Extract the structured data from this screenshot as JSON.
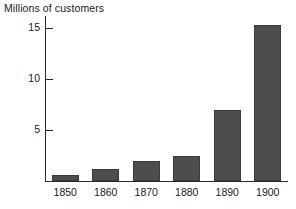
{
  "chart_data": {
    "type": "bar",
    "title": "",
    "ylabel": "Millions of customers",
    "xlabel": "",
    "categories": [
      "1850",
      "1860",
      "1870",
      "1880",
      "1890",
      "1900"
    ],
    "values": [
      0.6,
      1.2,
      2.0,
      2.5,
      7.0,
      15.3
    ],
    "ylim": [
      0,
      16.5
    ],
    "yticks": [
      5,
      10,
      15
    ],
    "ytick_labels": [
      "5",
      "10",
      "15"
    ],
    "grid": false,
    "legend": null,
    "bar_color": "#4d4d4d",
    "axis_color": "#2b2b2b",
    "series": [
      {
        "name": "Millions of customers",
        "values": [
          0.6,
          1.2,
          2.0,
          2.5,
          7.0,
          15.3
        ]
      }
    ]
  },
  "axis": {
    "y_title": "Millions of customers"
  }
}
